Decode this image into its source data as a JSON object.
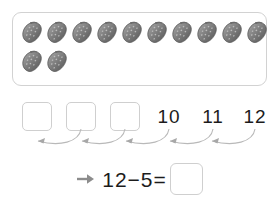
{
  "worksheet": {
    "title": "Subtraction counting-back worksheet",
    "colors": {
      "background": "#ffffff",
      "panel_border": "#d2d2d2",
      "box_border": "#cfcfcf",
      "text": "#1c1c1c",
      "arc": "#b4b4b4",
      "arrow": "#808080",
      "berry_dark": "#5e5e5e",
      "berry_mid": "#8a8a8a",
      "berry_light": "#b9b9b9"
    }
  },
  "berry_panel": {
    "icon_name": "strawberry-icon",
    "total_count": 12,
    "rows": [
      {
        "count": 10
      },
      {
        "count": 2
      }
    ]
  },
  "number_line": {
    "slots": [
      {
        "type": "box",
        "value": "",
        "x": 22
      },
      {
        "type": "box",
        "value": "",
        "x": 66
      },
      {
        "type": "box",
        "value": "",
        "x": 110
      },
      {
        "type": "number",
        "value": "10",
        "x": 154
      },
      {
        "type": "number",
        "value": "11",
        "x": 198
      },
      {
        "type": "number",
        "value": "12",
        "x": 240
      }
    ],
    "arcs": [
      {
        "from_x": 81,
        "to_x": 37
      },
      {
        "from_x": 125,
        "to_x": 81
      },
      {
        "from_x": 169,
        "to_x": 125
      },
      {
        "from_x": 213,
        "to_x": 169
      },
      {
        "from_x": 255,
        "to_x": 213
      }
    ],
    "arc_direction": "right-to-left",
    "hop_count": 5
  },
  "equation": {
    "arrow_icon": "right-arrow-icon",
    "minuend": "12",
    "minus_sign": "−",
    "subtrahend": "5",
    "equals_sign": "=",
    "expression": "12−5=",
    "answer_value": ""
  }
}
